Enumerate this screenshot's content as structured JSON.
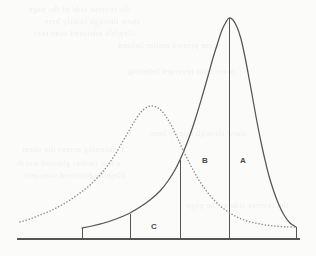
{
  "figure": {
    "background_color": "#fbfbfa",
    "stroke_color": "#555555",
    "label_color": "#4a4a4a"
  },
  "labels": {
    "region_a": "A",
    "region_b": "B",
    "region_c": "C"
  },
  "bleed_text": {
    "line1": "the reverse side of the page",
    "line2": "show through faintly here",
    "line3": "illegible mirrored scan text",
    "line4": "from printed matter behind",
    "line5": "more faint reversed lettering",
    "line6": "continuing across the sheet",
    "line7": "a few further ghosted words"
  },
  "chart_data": {
    "type": "line",
    "xlabel": "",
    "ylabel": "",
    "grid": false,
    "legend": "none",
    "xlim": [
      17,
      300
    ],
    "ylim": [
      0,
      1
    ],
    "axis_baseline_y": 239,
    "series": [
      {
        "name": "solid-curve",
        "style": "solid",
        "color": "#555555",
        "peak_x": 229,
        "peak_y": 18,
        "description": "tall narrow peaked curve, steep left flank, long right tail",
        "points": [
          [
            82,
            228
          ],
          [
            92,
            226
          ],
          [
            104,
            223
          ],
          [
            116,
            219
          ],
          [
            128,
            214
          ],
          [
            140,
            207
          ],
          [
            150,
            200
          ],
          [
            160,
            191
          ],
          [
            168,
            181
          ],
          [
            176,
            168
          ],
          [
            183,
            153
          ],
          [
            190,
            135
          ],
          [
            196,
            117
          ],
          [
            202,
            97
          ],
          [
            208,
            76
          ],
          [
            213,
            58
          ],
          [
            218,
            42
          ],
          [
            222,
            30
          ],
          [
            226,
            22
          ],
          [
            229,
            18
          ],
          [
            233,
            20
          ],
          [
            237,
            27
          ],
          [
            241,
            39
          ],
          [
            245,
            57
          ],
          [
            249,
            78
          ],
          [
            253,
            100
          ],
          [
            257,
            122
          ],
          [
            261,
            142
          ],
          [
            265,
            160
          ],
          [
            269,
            176
          ],
          [
            274,
            192
          ],
          [
            279,
            205
          ],
          [
            284,
            215
          ],
          [
            290,
            223
          ],
          [
            296,
            227
          ]
        ]
      },
      {
        "name": "dotted-curve",
        "style": "dotted",
        "color": "#8a8a8a",
        "peak_x": 150,
        "peak_y": 106,
        "description": "shorter broader dotted curve peaking left of the solid curve",
        "points": [
          [
            20,
            222
          ],
          [
            30,
            219
          ],
          [
            40,
            215
          ],
          [
            50,
            211
          ],
          [
            60,
            206
          ],
          [
            70,
            200
          ],
          [
            80,
            193
          ],
          [
            90,
            185
          ],
          [
            100,
            175
          ],
          [
            108,
            165
          ],
          [
            116,
            153
          ],
          [
            123,
            141
          ],
          [
            130,
            129
          ],
          [
            136,
            119
          ],
          [
            142,
            111
          ],
          [
            150,
            106
          ],
          [
            158,
            108
          ],
          [
            165,
            115
          ],
          [
            171,
            125
          ],
          [
            177,
            137
          ],
          [
            183,
            150
          ],
          [
            190,
            164
          ],
          [
            197,
            177
          ],
          [
            205,
            189
          ],
          [
            214,
            200
          ],
          [
            224,
            209
          ],
          [
            235,
            216
          ],
          [
            247,
            221
          ],
          [
            260,
            224
          ],
          [
            274,
            226
          ],
          [
            288,
            227
          ],
          [
            296,
            227
          ]
        ]
      }
    ],
    "dividers": [
      {
        "name": "divider-left-step",
        "x": 82,
        "top_y": 228
      },
      {
        "name": "divider-c-left",
        "x": 130,
        "top_y": 214
      },
      {
        "name": "divider-b-left",
        "x": 180,
        "top_y": 160
      },
      {
        "name": "divider-center-peak",
        "x": 229,
        "top_y": 18
      },
      {
        "name": "divider-right-step",
        "x": 296,
        "top_y": 227
      }
    ],
    "regions": [
      {
        "label": "A",
        "label_x": 243,
        "label_y": 160,
        "between_x": [
          229,
          296
        ]
      },
      {
        "label": "B",
        "label_x": 205,
        "label_y": 160,
        "between_x": [
          180,
          229
        ]
      },
      {
        "label": "C",
        "label_x": 154,
        "label_y": 226,
        "between_x": [
          130,
          180
        ]
      }
    ],
    "baseline": {
      "x_start": 17,
      "x_end": 300,
      "y": 239
    }
  }
}
